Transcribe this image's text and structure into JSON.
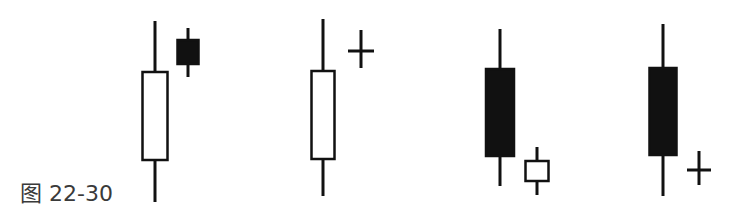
{
  "caption": "图 22-30",
  "colors": {
    "stroke": "#111111",
    "fill_black": "#111111",
    "fill_white": "#ffffff",
    "caption": "#3a3a3a"
  },
  "chart_data": {
    "type": "candlestick-diagram",
    "title": "图 22-30",
    "groups": [
      {
        "name": "pattern-1",
        "candles": [
          {
            "kind": "long-white",
            "cx": 155,
            "w": 25,
            "wick_top": 21,
            "body_top": 72,
            "body_bottom": 160,
            "wick_bottom": 202,
            "fill": "white"
          },
          {
            "kind": "small-black-gap-up",
            "cx": 188,
            "w": 21,
            "wick_top": 28,
            "body_top": 40,
            "body_bottom": 64,
            "wick_bottom": 77,
            "fill": "black"
          }
        ]
      },
      {
        "name": "pattern-2",
        "candles": [
          {
            "kind": "long-white",
            "cx": 323,
            "w": 23,
            "wick_top": 19,
            "body_top": 71,
            "body_bottom": 159,
            "wick_bottom": 196,
            "fill": "white"
          },
          {
            "kind": "doji-gap-up",
            "cx": 361,
            "w": 26,
            "wick_top": 30,
            "body_top": 51,
            "body_bottom": 51,
            "wick_bottom": 68,
            "fill": "doji"
          }
        ]
      },
      {
        "name": "pattern-3",
        "candles": [
          {
            "kind": "long-black",
            "cx": 500,
            "w": 28,
            "wick_top": 29,
            "body_top": 69,
            "body_bottom": 156,
            "wick_bottom": 186,
            "fill": "black"
          },
          {
            "kind": "small-white-gap-down",
            "cx": 537,
            "w": 23,
            "wick_top": 147,
            "body_top": 161,
            "body_bottom": 181,
            "wick_bottom": 195,
            "fill": "white"
          }
        ]
      },
      {
        "name": "pattern-4",
        "candles": [
          {
            "kind": "long-black",
            "cx": 663,
            "w": 27,
            "wick_top": 24,
            "body_top": 68,
            "body_bottom": 155,
            "wick_bottom": 196,
            "fill": "black"
          },
          {
            "kind": "doji-gap-down",
            "cx": 699,
            "w": 24,
            "wick_top": 151,
            "body_top": 170,
            "body_bottom": 170,
            "wick_bottom": 185,
            "fill": "doji"
          }
        ]
      }
    ]
  }
}
